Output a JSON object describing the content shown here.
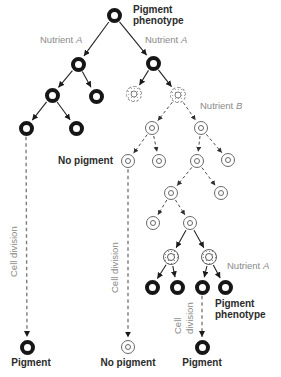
{
  "canvas": {
    "width": 281,
    "height": 377,
    "background": "#ffffff"
  },
  "colors": {
    "pigment_ring": "#161616",
    "thin_ring": "#6a6a6a",
    "stipple": "#8e8e8e",
    "solid_arrow": "#242424",
    "dashed_arrow": "#4c4c4c",
    "long_dashed_line": "#7d7d7d",
    "bold_text": "#2b2b2b",
    "gray_text": "#8a8a8a"
  },
  "labels": {
    "top_phenotype": {
      "line1": "Pigment",
      "line2": "phenotype"
    },
    "nutrient_a_left": {
      "word": "Nutrient",
      "letter": "A"
    },
    "nutrient_a_right": {
      "word": "Nutrient",
      "letter": "A"
    },
    "nutrient_b": {
      "word": "Nutrient",
      "letter": "B"
    },
    "nutrient_a_bottom": {
      "word": "Nutrient",
      "letter": "A"
    },
    "no_pigment_mid": "No pigment",
    "cell_division_left": "Cell division",
    "cell_division_mid": "Cell division",
    "cell_division_right": "Cell division",
    "bottom_phenotype": {
      "line1": "Pigment",
      "line2": "phenotype"
    },
    "result_left": "Pigment",
    "result_mid": "No pigment",
    "result_right": "Pigment"
  },
  "legend": {
    "pigment": "filled black ring cell",
    "plain": "thin double-ring cell (no pigment)",
    "stippled": "stippled ring cell",
    "stippled_dashed": "dashed stippled ring cell"
  },
  "nodes": [
    {
      "id": "n0",
      "x": 114,
      "y": 15,
      "style": "pigment"
    },
    {
      "id": "n1",
      "x": 78,
      "y": 64,
      "style": "pigment"
    },
    {
      "id": "n2",
      "x": 153,
      "y": 63,
      "style": "pigment"
    },
    {
      "id": "n3",
      "x": 52,
      "y": 95,
      "style": "pigment"
    },
    {
      "id": "n4",
      "x": 96,
      "y": 96,
      "style": "pigment"
    },
    {
      "id": "n5",
      "x": 26,
      "y": 128,
      "style": "pigment"
    },
    {
      "id": "n6",
      "x": 76,
      "y": 128,
      "style": "pigment"
    },
    {
      "id": "n7",
      "x": 134,
      "y": 94,
      "style": "stippled_dashed"
    },
    {
      "id": "n8",
      "x": 178,
      "y": 95,
      "style": "stippled_dashed"
    },
    {
      "id": "n9",
      "x": 152,
      "y": 128,
      "style": "plain"
    },
    {
      "id": "n10",
      "x": 201,
      "y": 128,
      "style": "plain"
    },
    {
      "id": "n11",
      "x": 128,
      "y": 161,
      "style": "plain"
    },
    {
      "id": "n12",
      "x": 159,
      "y": 161,
      "style": "plain"
    },
    {
      "id": "n13",
      "x": 197,
      "y": 161,
      "style": "plain"
    },
    {
      "id": "n14",
      "x": 228,
      "y": 160,
      "style": "plain"
    },
    {
      "id": "n15",
      "x": 171,
      "y": 193,
      "style": "plain"
    },
    {
      "id": "n16",
      "x": 221,
      "y": 193,
      "style": "plain"
    },
    {
      "id": "n17",
      "x": 153,
      "y": 223,
      "style": "plain"
    },
    {
      "id": "n18",
      "x": 190,
      "y": 223,
      "style": "plain"
    },
    {
      "id": "n19",
      "x": 171,
      "y": 257,
      "style": "stippled"
    },
    {
      "id": "n20",
      "x": 209,
      "y": 257,
      "style": "stippled"
    },
    {
      "id": "n21",
      "x": 152,
      "y": 287,
      "style": "pigment"
    },
    {
      "id": "n22",
      "x": 177,
      "y": 287,
      "style": "pigment"
    },
    {
      "id": "n23",
      "x": 202,
      "y": 287,
      "style": "pigment"
    },
    {
      "id": "n24",
      "x": 225,
      "y": 287,
      "style": "pigment"
    },
    {
      "id": "n25",
      "x": 27,
      "y": 347,
      "style": "pigment"
    },
    {
      "id": "n26",
      "x": 128,
      "y": 347,
      "style": "plain"
    },
    {
      "id": "n27",
      "x": 202,
      "y": 347,
      "style": "pigment"
    }
  ],
  "edges": [
    {
      "from": "n0",
      "to": "n1",
      "style": "solid"
    },
    {
      "from": "n0",
      "to": "n2",
      "style": "solid"
    },
    {
      "from": "n1",
      "to": "n3",
      "style": "solid"
    },
    {
      "from": "n1",
      "to": "n4",
      "style": "solid"
    },
    {
      "from": "n3",
      "to": "n5",
      "style": "solid"
    },
    {
      "from": "n3",
      "to": "n6",
      "style": "solid"
    },
    {
      "from": "n2",
      "to": "n7",
      "style": "solid"
    },
    {
      "from": "n2",
      "to": "n8",
      "style": "solid"
    },
    {
      "from": "n8",
      "to": "n9",
      "style": "dashed"
    },
    {
      "from": "n8",
      "to": "n10",
      "style": "dashed"
    },
    {
      "from": "n9",
      "to": "n11",
      "style": "dashed"
    },
    {
      "from": "n9",
      "to": "n12",
      "style": "dashed"
    },
    {
      "from": "n10",
      "to": "n13",
      "style": "dashed"
    },
    {
      "from": "n10",
      "to": "n14",
      "style": "dashed"
    },
    {
      "from": "n13",
      "to": "n15",
      "style": "dashed"
    },
    {
      "from": "n13",
      "to": "n16",
      "style": "dashed"
    },
    {
      "from": "n15",
      "to": "n17",
      "style": "dashed"
    },
    {
      "from": "n15",
      "to": "n18",
      "style": "dashed"
    },
    {
      "from": "n18",
      "to": "n19",
      "style": "solid"
    },
    {
      "from": "n18",
      "to": "n20",
      "style": "solid"
    },
    {
      "from": "n19",
      "to": "n21",
      "style": "solid"
    },
    {
      "from": "n19",
      "to": "n22",
      "style": "solid"
    },
    {
      "from": "n20",
      "to": "n23",
      "style": "solid"
    },
    {
      "from": "n20",
      "to": "n24",
      "style": "solid"
    },
    {
      "from": "n5",
      "to": "n25",
      "style": "long_dashed"
    },
    {
      "from": "n11",
      "to": "n26",
      "style": "long_dashed"
    },
    {
      "from": "n23",
      "to": "n27",
      "style": "long_dashed"
    }
  ]
}
